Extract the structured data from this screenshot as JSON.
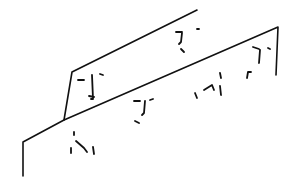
{
  "drawing": {
    "width": 294,
    "height": 192,
    "background": "#ffffff",
    "stroke_color": "#111111",
    "panels": [
      {
        "name": "back-panel",
        "stroke_width": 1.6,
        "path": "M197,10 L72,72 L64,120"
      },
      {
        "name": "front-panel",
        "stroke_width": 1.6,
        "path": "M23,176 L23,142 L64,120 L278,27 L276,75"
      }
    ],
    "faces": [
      {
        "name": "face-back-top-right",
        "path": "M176,32 L182,32 M182,33 L181,42 L179,44 M197,29 L199,29 M181,49 L184,52"
      },
      {
        "name": "face-back-left",
        "path": "M78,80 L84,80 M92,75 L93,99 L91,99 M100,74 L103,75 M89,96 L94,97"
      },
      {
        "name": "face-front-middle",
        "path": "M134,101 L140,101 M145,101 L144,113 L142,115 M150,100 L153,99 M135,121 L139,123"
      },
      {
        "name": "face-front-right",
        "path": "M253,47 L259,49 M260,50 L259,63 M268,48 L270,49 M247,78 L248,72 L251,72"
      },
      {
        "name": "face-front-right-mid",
        "path": "M195,93 L197,98 M204,90 L212,85 L214,90 M220,73 L221,78 M220,86 L221,95"
      },
      {
        "name": "face-front-bottom-left",
        "path": "M74,132 L74,135 M71,148 L71,153 M76,141 L84,148 L87,152 M93,147 L94,154"
      }
    ]
  }
}
